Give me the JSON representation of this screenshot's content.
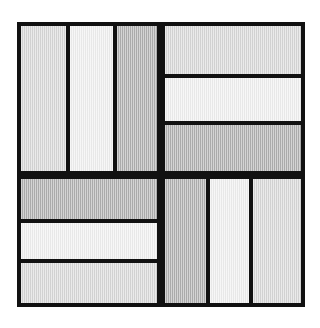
{
  "figure": {
    "background_color": "#ffffff",
    "line_color": "#111111",
    "canvas": {
      "width": 320,
      "height": 328
    },
    "block": {
      "x": 17,
      "y": 22,
      "width": 288,
      "height": 285
    },
    "border_thickness": 4,
    "sashing_thickness": 4,
    "palette": {
      "light_gray": "#d9d9d9",
      "pale_gray": "#f0f0f0",
      "dark_gray": "#b0b0b0"
    },
    "quadrants": [
      {
        "name": "top-left",
        "orientation": "vertical",
        "x": 17,
        "y": 22,
        "width": 144,
        "height": 153,
        "bars": [
          {
            "label": "bar-1",
            "shade": "light_gray",
            "x": 21,
            "y": 26,
            "width": 45,
            "height": 145
          },
          {
            "label": "bar-2",
            "shade": "pale_gray",
            "x": 70,
            "y": 26,
            "width": 43,
            "height": 145
          },
          {
            "label": "bar-3",
            "shade": "dark_gray",
            "x": 117,
            "y": 26,
            "width": 40,
            "height": 145
          }
        ]
      },
      {
        "name": "top-right",
        "orientation": "horizontal",
        "x": 161,
        "y": 22,
        "width": 144,
        "height": 153,
        "bars": [
          {
            "label": "bar-1",
            "shade": "light_gray",
            "x": 165,
            "y": 26,
            "width": 136,
            "height": 48
          },
          {
            "label": "bar-2",
            "shade": "pale_gray",
            "x": 165,
            "y": 78,
            "width": 136,
            "height": 43
          },
          {
            "label": "bar-3",
            "shade": "dark_gray",
            "x": 165,
            "y": 125,
            "width": 136,
            "height": 46
          }
        ]
      },
      {
        "name": "bottom-left",
        "orientation": "horizontal",
        "x": 17,
        "y": 175,
        "width": 144,
        "height": 132,
        "bars": [
          {
            "label": "bar-1",
            "shade": "dark_gray",
            "x": 21,
            "y": 179,
            "width": 136,
            "height": 40
          },
          {
            "label": "bar-2",
            "shade": "pale_gray",
            "x": 21,
            "y": 223,
            "width": 136,
            "height": 36
          },
          {
            "label": "bar-3",
            "shade": "light_gray",
            "x": 21,
            "y": 263,
            "width": 136,
            "height": 40
          }
        ]
      },
      {
        "name": "bottom-right",
        "orientation": "vertical",
        "x": 161,
        "y": 175,
        "width": 144,
        "height": 132,
        "bars": [
          {
            "label": "bar-1",
            "shade": "dark_gray",
            "x": 165,
            "y": 179,
            "width": 41,
            "height": 124
          },
          {
            "label": "bar-2",
            "shade": "pale_gray",
            "x": 210,
            "y": 179,
            "width": 39,
            "height": 124
          },
          {
            "label": "bar-3",
            "shade": "light_gray",
            "x": 253,
            "y": 179,
            "width": 48,
            "height": 124
          }
        ]
      }
    ]
  }
}
